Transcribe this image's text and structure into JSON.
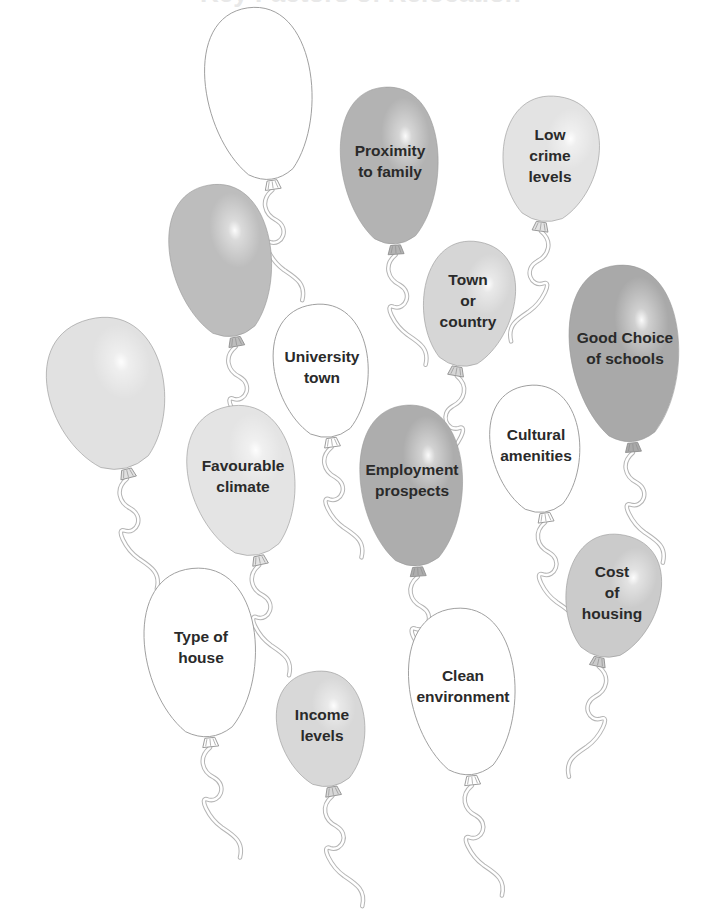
{
  "title": "Key Factors of Relocation",
  "title_visible": "partially cut off at top edge",
  "diagram": {
    "type": "balloon-cloud",
    "balloons": [
      {
        "id": "blank-top",
        "label": "",
        "cx": 260,
        "cy": 95,
        "rx": 64,
        "ry": 88,
        "rot": -8,
        "fill": "#ffffff",
        "tone": "white"
      },
      {
        "id": "proximity",
        "label": "Proximity\nto family",
        "cx": 390,
        "cy": 167,
        "rx": 59,
        "ry": 80,
        "rot": -4,
        "fill": "#b3b3b3",
        "tone": "dark"
      },
      {
        "id": "low-crime",
        "label": "Low\ncrime\nlevels",
        "cx": 550,
        "cy": 160,
        "rx": 58,
        "ry": 64,
        "rot": 8,
        "fill": "#e3e3e3",
        "tone": "light"
      },
      {
        "id": "blank-mid",
        "label": "",
        "cx": 222,
        "cy": 262,
        "rx": 61,
        "ry": 78,
        "rot": -10,
        "fill": "#bdbdbd",
        "tone": "mid-dark"
      },
      {
        "id": "town-country",
        "label": "Town\nor\ncountry",
        "cx": 468,
        "cy": 305,
        "rx": 55,
        "ry": 64,
        "rot": 10,
        "fill": "#d6d6d6",
        "tone": "light-mid"
      },
      {
        "id": "good-schools",
        "label": "Good Choice\nof schools",
        "cx": 625,
        "cy": 355,
        "rx": 66,
        "ry": 90,
        "rot": -5,
        "fill": "#a9a9a9",
        "tone": "dark"
      },
      {
        "id": "blank-left",
        "label": "",
        "cx": 108,
        "cy": 395,
        "rx": 70,
        "ry": 78,
        "rot": -14,
        "fill": "#e1e1e1",
        "tone": "light"
      },
      {
        "id": "university",
        "label": "University\ntown",
        "cx": 322,
        "cy": 372,
        "rx": 57,
        "ry": 68,
        "rot": -8,
        "fill": "#ffffff",
        "tone": "white"
      },
      {
        "id": "climate",
        "label": "Favourable\nclimate",
        "cx": 243,
        "cy": 482,
        "rx": 64,
        "ry": 77,
        "rot": -12,
        "fill": "#e4e4e4",
        "tone": "light"
      },
      {
        "id": "employment",
        "label": "Employment\nprospects",
        "cx": 412,
        "cy": 487,
        "rx": 62,
        "ry": 82,
        "rot": -4,
        "fill": "#adadad",
        "tone": "dark"
      },
      {
        "id": "cultural",
        "label": "Cultural\namenities",
        "cx": 536,
        "cy": 450,
        "rx": 54,
        "ry": 65,
        "rot": -8,
        "fill": "#ffffff",
        "tone": "white"
      },
      {
        "id": "cost-housing",
        "label": "Cost\nof\nhousing",
        "cx": 612,
        "cy": 597,
        "rx": 57,
        "ry": 63,
        "rot": 12,
        "fill": "#cbcbcb",
        "tone": "mid"
      },
      {
        "id": "type-house",
        "label": "Type of\nhouse",
        "cx": 201,
        "cy": 654,
        "rx": 67,
        "ry": 86,
        "rot": -6,
        "fill": "#ffffff",
        "tone": "white"
      },
      {
        "id": "clean-env",
        "label": "Clean\nenvironment",
        "cx": 463,
        "cy": 693,
        "rx": 64,
        "ry": 85,
        "rot": -6,
        "fill": "#ffffff",
        "tone": "white"
      },
      {
        "id": "income",
        "label": "Income\nlevels",
        "cx": 322,
        "cy": 730,
        "rx": 53,
        "ry": 59,
        "rot": -10,
        "fill": "#d8d8d8",
        "tone": "light-mid"
      }
    ],
    "labels": {
      "proximity": "Proximity to family",
      "low_crime": "Low crime levels",
      "town_country": "Town or country",
      "good_schools": "Good Choice of schools",
      "university": "University town",
      "climate": "Favourable climate",
      "employment": "Employment prospects",
      "cultural": "Cultural amenities",
      "cost_housing": "Cost of housing",
      "type_house": "Type of house",
      "clean_env": "Clean environment",
      "income": "Income levels"
    },
    "colors": {
      "outline": "#9a9a9a",
      "string": "#b5b5b5",
      "text": "#2a2a2a",
      "background": "#ffffff"
    }
  }
}
